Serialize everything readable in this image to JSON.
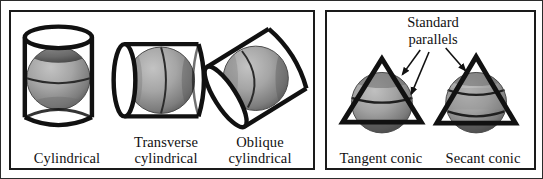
{
  "figure": {
    "background": "#ffffff",
    "border_color": "#2b2b2b"
  },
  "panels": [
    {
      "id": "cylindrical",
      "name": "Cylindrical projections panel",
      "captions": [
        {
          "id": "cylindrical",
          "text": "Cylindrical"
        },
        {
          "id": "transverse",
          "text": "Transverse\ncylindrical"
        },
        {
          "id": "oblique",
          "text": "Oblique\ncylindrical"
        }
      ]
    },
    {
      "id": "conic",
      "name": "Conic projections panel",
      "annotation": {
        "id": "standard-parallels",
        "text": "Standard\nparallels"
      },
      "captions": [
        {
          "id": "tangent",
          "text": "Tangent conic"
        },
        {
          "id": "secant",
          "text": "Secant conic"
        }
      ]
    }
  ],
  "colors": {
    "outline": "#1a1a1a",
    "sphere_light": "#b9b9b9",
    "sphere_mid": "#9a9a9a",
    "sphere_dark": "#5f5f5f",
    "sphere_shadow": "#4a4a4a",
    "surface_fill": "#ffffff",
    "text": "#111111"
  },
  "diagram_elements": {
    "cylindrical": "upright cylinder enclosing a shaded sphere, tangent at equator",
    "transverse_cylindrical": "cylinder rotated 90 degrees, horizontal axis, enclosing sphere",
    "oblique_cylindrical": "cylinder tilted at an oblique angle enclosing sphere",
    "tangent_conic": "cone (triangle) resting on sphere touching along one standard parallel",
    "secant_conic": "cone (triangle) cutting sphere along two standard parallels",
    "arrows": 3
  }
}
